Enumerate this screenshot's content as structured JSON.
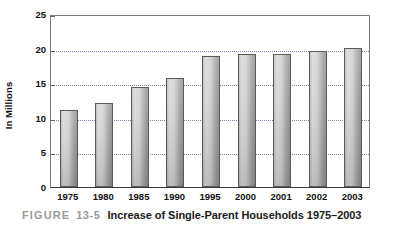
{
  "chart_data": {
    "type": "bar",
    "title": "Increase of Single-Parent Households 1975–2003",
    "xlabel": "",
    "ylabel": "In Millions",
    "categories": [
      "1975",
      "1980",
      "1985",
      "1990",
      "1995",
      "2000",
      "2001",
      "2002",
      "2003"
    ],
    "values": [
      11.2,
      12.1,
      14.5,
      15.8,
      18.9,
      19.2,
      19.2,
      19.7,
      20.1
    ],
    "ylim": [
      0,
      25
    ],
    "yticks": [
      0,
      5,
      10,
      15,
      20,
      25
    ],
    "ytick_labels": [
      "0",
      "5",
      "10",
      "15",
      "20",
      "25"
    ],
    "grid": true,
    "grid_axis": "y",
    "grid_style": "dotted",
    "legend": false,
    "legend_position": "none",
    "bar_fill": "#cfcfcf",
    "bar_edge": "#5b5b5b",
    "grid_color": "#7b86ab",
    "axis_color": "#5a5a5a"
  },
  "caption": {
    "figure_word": "FIGURE",
    "figure_number": "13-5",
    "figure_title": "Increase of Single-Parent Households 1975–2003"
  }
}
